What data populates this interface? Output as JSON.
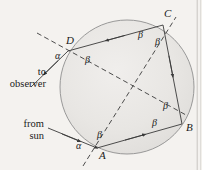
{
  "figure": {
    "background_color": "#f4f2ef",
    "drop_fill": "#e6e4e1",
    "drop_stroke": "#8d8d8d",
    "ray_color": "#3a3a3a",
    "dash_color": "#3a3a3a",
    "border_color": "#c9c6c1"
  },
  "labels": {
    "point_a": "A",
    "point_b": "B",
    "point_c": "C",
    "point_d": "D",
    "alpha_at_d": "α",
    "alpha_at_a": "α",
    "beta_d": "β",
    "beta_c_left": "β",
    "beta_c_right": "β",
    "beta_b_upper": "β",
    "beta_b_lower": "β",
    "beta_a": "β"
  },
  "annotations": {
    "to_observer_line1": "to",
    "to_observer_line2": "observer",
    "from_sun_line1": "from",
    "from_sun_line2": "sun"
  },
  "geometry": {
    "circle_center_x": 127,
    "circle_center_y": 87,
    "circle_radius": 67,
    "point_a": [
      97,
      148
    ],
    "point_b": [
      182,
      124
    ],
    "point_c": [
      163,
      25
    ],
    "point_d": [
      68,
      51
    ]
  }
}
